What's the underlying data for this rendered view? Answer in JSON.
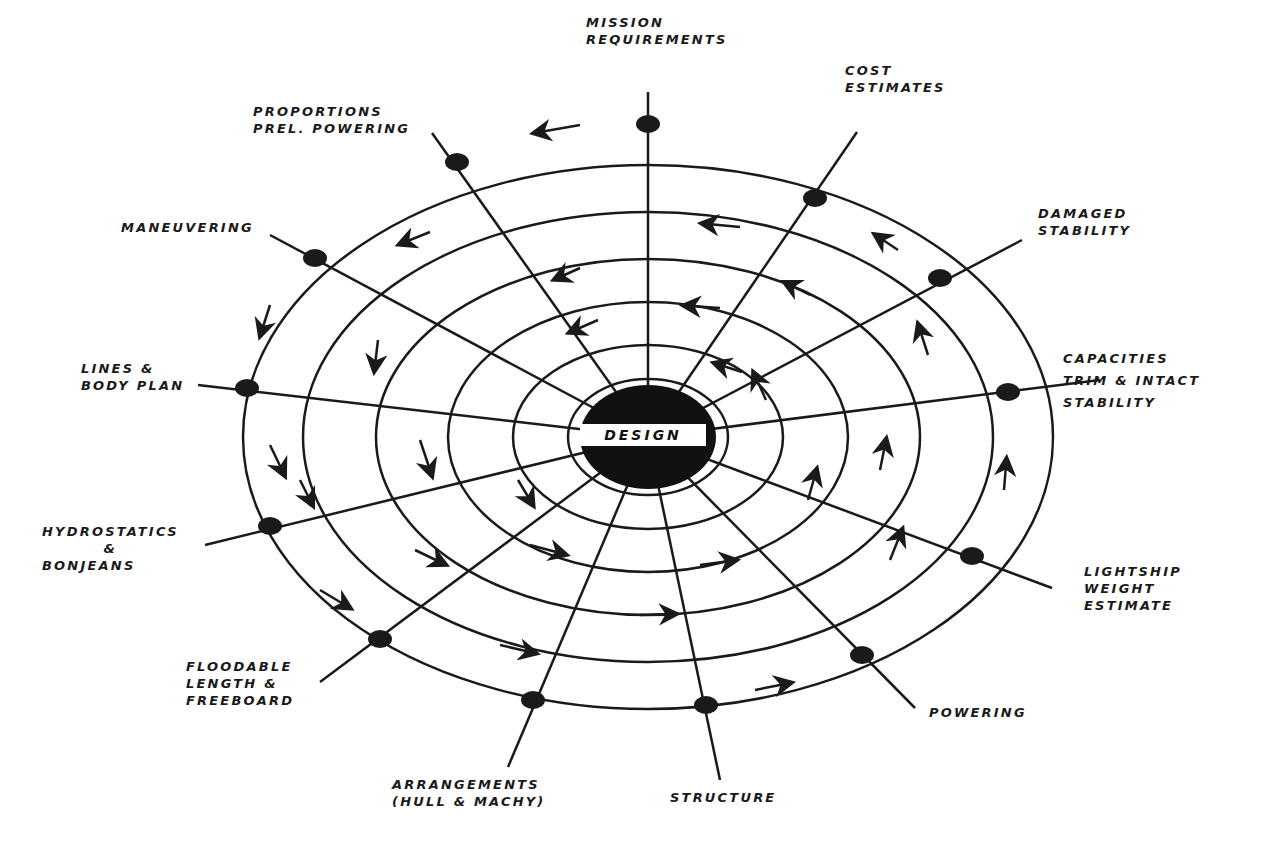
{
  "diagram": {
    "center": {
      "label": "DESIGN"
    },
    "nodes": [
      {
        "id": "mission",
        "lines": [
          "MISSION",
          "REQUIREMENTS"
        ]
      },
      {
        "id": "cost",
        "lines": [
          "COST",
          "ESTIMATES"
        ]
      },
      {
        "id": "damaged",
        "lines": [
          "DAMAGED",
          "STABILITY"
        ]
      },
      {
        "id": "capacities",
        "lines": [
          "CAPACITIES",
          "TRIM & INTACT",
          "STABILITY"
        ]
      },
      {
        "id": "lightship",
        "lines": [
          "LIGHTSHIP",
          "WEIGHT",
          "ESTIMATE"
        ]
      },
      {
        "id": "powering",
        "lines": [
          "POWERING"
        ]
      },
      {
        "id": "structure",
        "lines": [
          "STRUCTURE"
        ]
      },
      {
        "id": "arrangements",
        "lines": [
          "ARRANGEMENTS",
          "(HULL & MACHY)"
        ]
      },
      {
        "id": "floodable",
        "lines": [
          "FLOODABLE",
          "LENGTH &",
          "FREEBOARD"
        ]
      },
      {
        "id": "hydrostatics",
        "lines": [
          "HYDROSTATICS",
          "&",
          "BONJEANS"
        ]
      },
      {
        "id": "lines",
        "lines": [
          "LINES &",
          "BODY PLAN"
        ]
      },
      {
        "id": "maneuvering",
        "lines": [
          "MANEUVERING"
        ]
      },
      {
        "id": "proportions",
        "lines": [
          "PROPORTIONS",
          "PREL. POWERING"
        ]
      }
    ],
    "colors": {
      "ink": "#1a1a1a",
      "background": "#ffffff"
    }
  }
}
